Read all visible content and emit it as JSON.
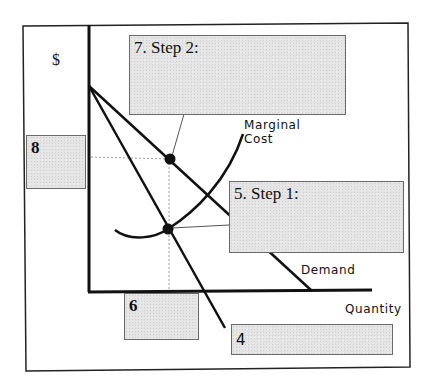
{
  "diagram": {
    "type": "economics-graph",
    "axes": {
      "y_label": "$",
      "x_label": "Quantity"
    },
    "curves": {
      "demand_label": "Demand",
      "marginal_cost_label_line1": "Marginal",
      "marginal_cost_label_line2": "Cost"
    },
    "answer_boxes": [
      {
        "id": "7",
        "label": "7.  Step 2:"
      },
      {
        "id": "8",
        "label": "8"
      },
      {
        "id": "5",
        "label": "5.  Step 1:"
      },
      {
        "id": "6",
        "label": "6"
      },
      {
        "id": "4",
        "label": "4"
      }
    ],
    "colors": {
      "line": "#111111",
      "box_fill": "#e4e4e4",
      "box_border": "#6a6a6a",
      "guide": "#9a9a9a"
    }
  }
}
